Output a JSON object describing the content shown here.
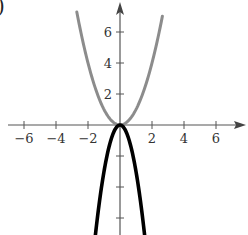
{
  "figure": {
    "part_label": ")"
  },
  "chart_data": {
    "type": "line",
    "title": "",
    "xlabel": "",
    "ylabel": "",
    "xlim": [
      -7.5,
      8
    ],
    "ylim": [
      -7.1,
      7.8
    ],
    "grid": false,
    "x_ticks": [
      -6,
      -4,
      -2,
      2,
      4,
      6
    ],
    "x_tick_labels": [
      "−6",
      "−4",
      "−2",
      "2",
      "4",
      "6"
    ],
    "y_ticks": [
      -6,
      -4,
      -2,
      2,
      4,
      6
    ],
    "y_tick_labels": [
      "",
      "",
      "",
      "2",
      "4",
      "6"
    ],
    "series": [
      {
        "name": "y = x^2",
        "color": "#8c8c8c",
        "equation": "y = x^2",
        "x": [
          -2.7,
          -2,
          -1.5,
          -1,
          -0.5,
          0,
          0.5,
          1,
          1.5,
          2,
          2.65
        ],
        "values": [
          7.29,
          4,
          2.25,
          1,
          0.25,
          0,
          0.25,
          1,
          2.25,
          4,
          7.02
        ]
      },
      {
        "name": "y = -3x^2",
        "color": "#000000",
        "equation": "y = -3x^2",
        "x": [
          -1.55,
          -1.25,
          -1,
          -0.5,
          0,
          0.5,
          1,
          1.25,
          1.55
        ],
        "values": [
          -7.21,
          -4.69,
          -3,
          -0.75,
          0,
          -0.75,
          -3,
          -4.69,
          -7.21
        ]
      }
    ]
  }
}
